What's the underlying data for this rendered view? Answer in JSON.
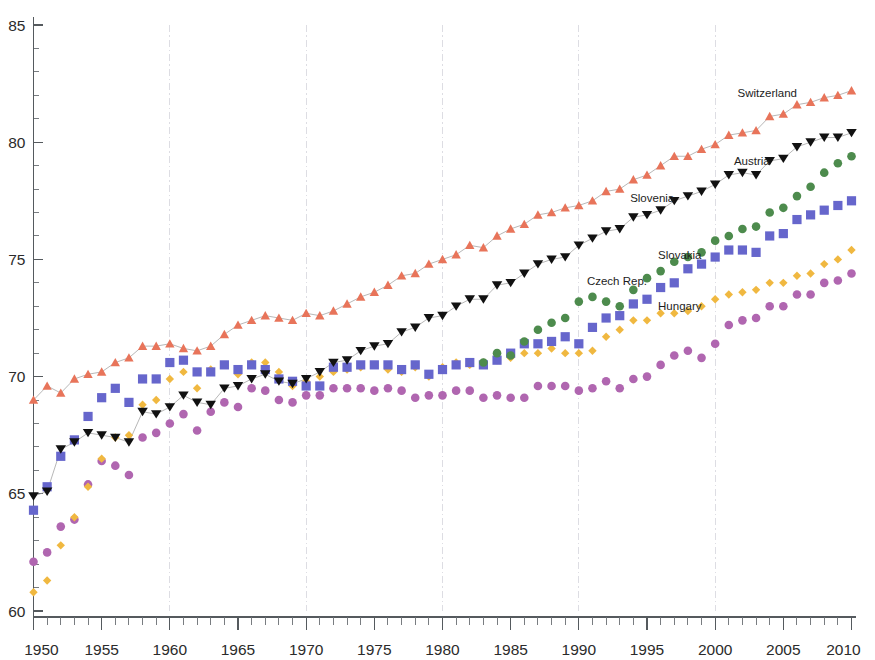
{
  "chart_data": {
    "type": "scatter",
    "title": "",
    "subtitle": "",
    "xlabel": "",
    "ylabel": "",
    "xlim": [
      1950,
      2010
    ],
    "ylim": [
      60,
      85
    ],
    "x_tick_labels": [
      "1950",
      "1955",
      "1960",
      "1965",
      "1970",
      "1975",
      "1980",
      "1985",
      "1990",
      "1995",
      "2000",
      "2005",
      "2010"
    ],
    "x_tick_values": [
      1950,
      1955,
      1960,
      1965,
      1970,
      1975,
      1980,
      1985,
      1990,
      1995,
      2000,
      2005,
      2010
    ],
    "x_minor_step": 1,
    "y_tick_labels": [
      "60",
      "65",
      "70",
      "75",
      "80",
      "85"
    ],
    "y_tick_values": [
      60,
      65,
      70,
      75,
      80,
      85
    ],
    "y_minor_step": 1,
    "grid": "vertical-dashed-every-10-years",
    "gridline_values": [
      1960,
      1970,
      1980,
      1990,
      2000
    ],
    "legend_position": "inline-annotations-right",
    "x": [
      1950,
      1951,
      1952,
      1953,
      1954,
      1955,
      1956,
      1957,
      1958,
      1959,
      1960,
      1961,
      1962,
      1963,
      1964,
      1965,
      1966,
      1967,
      1968,
      1969,
      1970,
      1971,
      1972,
      1973,
      1974,
      1975,
      1976,
      1977,
      1978,
      1979,
      1980,
      1981,
      1982,
      1983,
      1984,
      1985,
      1986,
      1987,
      1988,
      1989,
      1990,
      1991,
      1992,
      1993,
      1994,
      1995,
      1996,
      1997,
      1998,
      1999,
      2000,
      2001,
      2002,
      2003,
      2004,
      2005,
      2006,
      2007,
      2008,
      2009,
      2010
    ],
    "series": [
      {
        "name": "Switzerland",
        "color": "#e8745a",
        "marker": "triangle-up",
        "has_line": true,
        "label_anchor_year": 2006,
        "label_anchor_value": 82.1,
        "values": [
          69.0,
          69.6,
          69.3,
          69.9,
          70.1,
          70.2,
          70.6,
          70.8,
          71.3,
          71.3,
          71.4,
          71.2,
          71.1,
          71.3,
          71.8,
          72.2,
          72.4,
          72.6,
          72.5,
          72.4,
          72.7,
          72.6,
          72.8,
          73.1,
          73.4,
          73.6,
          73.9,
          74.3,
          74.4,
          74.8,
          75.0,
          75.2,
          75.6,
          75.5,
          76.0,
          76.3,
          76.5,
          76.9,
          77.0,
          77.2,
          77.3,
          77.5,
          77.9,
          78.0,
          78.4,
          78.6,
          79.0,
          79.4,
          79.4,
          79.7,
          79.9,
          80.3,
          80.4,
          80.5,
          81.1,
          81.2,
          81.6,
          81.7,
          81.9,
          82.0,
          82.2
        ]
      },
      {
        "name": "Austria",
        "color": "#111111",
        "marker": "triangle-down",
        "has_line": true,
        "label_anchor_year": 2004,
        "label_anchor_value": 79.2,
        "values": [
          64.9,
          65.1,
          66.9,
          67.2,
          67.6,
          67.5,
          67.4,
          67.2,
          68.5,
          68.4,
          68.7,
          69.2,
          68.9,
          68.8,
          69.5,
          69.6,
          69.9,
          70.1,
          69.8,
          69.7,
          69.9,
          70.2,
          70.6,
          70.7,
          71.1,
          71.3,
          71.4,
          71.9,
          72.1,
          72.5,
          72.6,
          73.0,
          73.3,
          73.3,
          73.9,
          74.0,
          74.4,
          74.8,
          75.0,
          75.1,
          75.6,
          75.9,
          76.2,
          76.3,
          76.8,
          76.9,
          77.1,
          77.5,
          77.7,
          77.9,
          78.2,
          78.6,
          78.7,
          78.6,
          79.2,
          79.3,
          79.8,
          80.0,
          80.2,
          80.2,
          80.4
        ]
      },
      {
        "name": "Slovenia",
        "color": "#4d8b4d",
        "marker": "circle",
        "has_line": false,
        "label_anchor_year": 1997,
        "label_anchor_value": 77.6,
        "values": [
          null,
          null,
          null,
          null,
          null,
          null,
          null,
          null,
          null,
          null,
          null,
          null,
          null,
          null,
          null,
          null,
          null,
          null,
          null,
          null,
          null,
          null,
          null,
          null,
          null,
          null,
          null,
          null,
          null,
          null,
          null,
          null,
          null,
          70.6,
          71.0,
          70.9,
          71.5,
          72.0,
          72.3,
          72.5,
          73.2,
          73.4,
          73.2,
          73.0,
          73.7,
          74.2,
          74.5,
          74.9,
          75.1,
          75.3,
          75.8,
          76.0,
          76.3,
          76.4,
          77.0,
          77.2,
          77.7,
          78.1,
          78.7,
          79.1,
          79.4
        ]
      },
      {
        "name": "Czech Rep.",
        "color": "#6666cc",
        "marker": "square",
        "has_line": false,
        "label_anchor_year": 1995,
        "label_anchor_value": 74.1,
        "values": [
          64.3,
          65.3,
          66.6,
          67.3,
          68.3,
          69.1,
          69.5,
          68.9,
          69.9,
          69.9,
          70.6,
          70.7,
          70.2,
          70.2,
          70.5,
          70.3,
          70.5,
          70.3,
          69.9,
          69.8,
          69.6,
          69.6,
          70.4,
          70.4,
          70.5,
          70.5,
          70.5,
          70.3,
          70.5,
          70.1,
          70.3,
          70.5,
          70.6,
          70.5,
          70.7,
          71.0,
          71.4,
          71.4,
          71.5,
          71.7,
          71.4,
          72.1,
          72.5,
          72.6,
          73.1,
          73.3,
          73.8,
          74.0,
          74.6,
          74.8,
          75.1,
          75.4,
          75.4,
          75.3,
          76.0,
          76.1,
          76.7,
          76.9,
          77.1,
          77.3,
          77.5
        ]
      },
      {
        "name": "Slovakia",
        "color": "#f0b840",
        "marker": "diamond",
        "has_line": false,
        "label_anchor_year": 1999,
        "label_anchor_value": 75.2,
        "values": [
          60.8,
          61.3,
          62.8,
          64.0,
          65.3,
          66.5,
          67.4,
          67.5,
          68.8,
          69.0,
          69.9,
          70.2,
          69.5,
          70.3,
          70.5,
          70.1,
          70.6,
          70.6,
          70.2,
          69.6,
          69.8,
          70.0,
          70.2,
          70.3,
          70.4,
          70.5,
          70.3,
          70.2,
          70.4,
          70.0,
          70.4,
          70.6,
          70.5,
          70.6,
          70.7,
          70.8,
          71.0,
          71.0,
          71.2,
          71.0,
          71.0,
          71.1,
          71.7,
          72.0,
          72.4,
          72.4,
          72.7,
          72.7,
          72.8,
          73.0,
          73.3,
          73.5,
          73.6,
          73.7,
          74.0,
          74.0,
          74.3,
          74.4,
          74.8,
          75.0,
          75.4
        ]
      },
      {
        "name": "Hungary",
        "color": "#b066b0",
        "marker": "circle",
        "has_line": false,
        "label_anchor_year": 1999,
        "label_anchor_value": 73.0,
        "values": [
          62.1,
          62.5,
          63.6,
          63.9,
          65.4,
          66.4,
          66.2,
          65.8,
          67.4,
          67.6,
          68.0,
          68.4,
          67.7,
          68.5,
          68.9,
          68.7,
          69.5,
          69.4,
          69.0,
          68.9,
          69.2,
          69.2,
          69.5,
          69.5,
          69.5,
          69.4,
          69.5,
          69.4,
          69.1,
          69.2,
          69.2,
          69.4,
          69.4,
          69.1,
          69.2,
          69.1,
          69.1,
          69.6,
          69.6,
          69.6,
          69.4,
          69.5,
          69.8,
          69.5,
          69.9,
          70.0,
          70.5,
          70.9,
          71.1,
          70.8,
          71.4,
          72.2,
          72.4,
          72.5,
          73.0,
          73.0,
          73.5,
          73.5,
          74.0,
          74.1,
          74.4
        ]
      }
    ]
  }
}
